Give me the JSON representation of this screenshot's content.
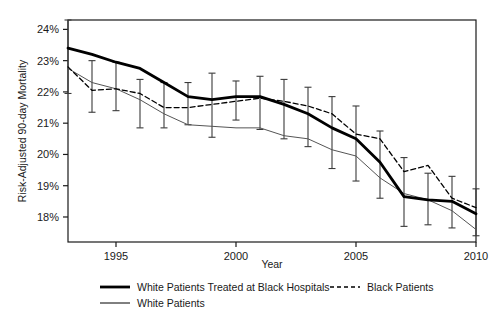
{
  "chart_data": {
    "type": "line",
    "title": "",
    "xlabel": "Year",
    "ylabel": "Risk-Adjusted 90-day Mortality",
    "xlim": [
      1993,
      2010
    ],
    "ylim": [
      17.2,
      24.3
    ],
    "grid": false,
    "legend_position": "bottom",
    "x_ticks": [
      "1995",
      "2000",
      "2005",
      "2010"
    ],
    "x_tick_values": [
      1995,
      2000,
      2005,
      2010
    ],
    "y_ticks": [
      "18%",
      "19%",
      "20%",
      "21%",
      "22%",
      "23%",
      "24%"
    ],
    "y_tick_values": [
      18,
      19,
      20,
      21,
      22,
      23,
      24
    ],
    "x": [
      1993,
      1994,
      1995,
      1996,
      1997,
      1998,
      1999,
      2000,
      2001,
      2002,
      2003,
      2004,
      2005,
      2006,
      2007,
      2008,
      2009,
      2010
    ],
    "series": [
      {
        "name": "White Patients Treated at Black Hospitals",
        "style": "thick-solid",
        "color": "#000000",
        "values": [
          23.4,
          23.2,
          22.95,
          22.75,
          22.3,
          21.85,
          21.75,
          21.85,
          21.85,
          21.6,
          21.3,
          20.85,
          20.5,
          19.75,
          18.65,
          18.55,
          18.5,
          18.1
        ],
        "errors_low": [
          21.95,
          21.35,
          21.4,
          20.85,
          20.85,
          20.95,
          20.55,
          21.1,
          20.8,
          20.5,
          20.25,
          19.55,
          19.15,
          18.6,
          17.7,
          17.75,
          17.65,
          17.4
        ],
        "errors_high": [
          24.3,
          23.0,
          22.95,
          22.4,
          22.3,
          22.3,
          22.6,
          22.35,
          22.5,
          22.4,
          22.15,
          21.85,
          21.55,
          20.75,
          19.9,
          19.4,
          19.3,
          18.9
        ]
      },
      {
        "name": "Black Patients",
        "style": "dashed",
        "color": "#000000",
        "values": [
          22.8,
          22.05,
          22.1,
          21.95,
          21.5,
          21.5,
          21.6,
          21.7,
          21.8,
          21.7,
          21.55,
          21.3,
          20.65,
          20.5,
          19.45,
          19.65,
          18.6,
          18.3
        ]
      },
      {
        "name": "White Patients",
        "style": "thin-solid",
        "color": "#555555",
        "values": [
          22.75,
          22.3,
          22.1,
          21.75,
          21.3,
          20.95,
          20.9,
          20.85,
          20.85,
          20.6,
          20.5,
          20.15,
          19.95,
          19.25,
          18.75,
          18.55,
          18.2,
          17.6
        ]
      }
    ]
  },
  "legend": {
    "entries": [
      {
        "label": "White Patients Treated at Black Hospitals",
        "style": "thick-solid"
      },
      {
        "label": "Black Patients",
        "style": "dashed"
      },
      {
        "label": "White Patients",
        "style": "thin-solid"
      }
    ]
  },
  "axes": {
    "x_title": "Year",
    "y_title": "Risk-Adjusted 90-day Mortality"
  }
}
